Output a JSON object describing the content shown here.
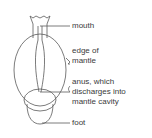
{
  "diagram": {
    "stroke_color": "#5a5a5a",
    "text_color": "#3a3a3a",
    "labels": [
      {
        "id": "mouth",
        "lines": [
          "mouth"
        ]
      },
      {
        "id": "edge-of-mantle",
        "lines": [
          "edge of",
          "mantle"
        ]
      },
      {
        "id": "anus",
        "lines": [
          "anus, which",
          "discharges into",
          "mantle cavity"
        ]
      },
      {
        "id": "foot",
        "lines": [
          "foot"
        ]
      }
    ]
  }
}
